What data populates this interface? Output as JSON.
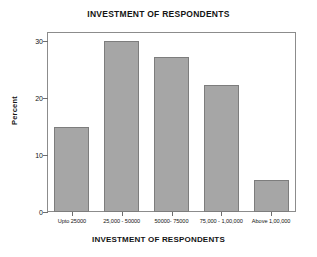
{
  "chart_data": {
    "type": "bar",
    "title": "INVESTMENT OF RESPONDENTS",
    "xlabel": "INVESTMENT OF RESPONDENTS",
    "ylabel": "Percent",
    "categories": [
      "Upto 25000",
      "25,000 - 50000",
      "50000- 75000",
      "75,000 - 1,00,000",
      "Above 1,00,000"
    ],
    "values": [
      14.8,
      30.0,
      27.2,
      22.3,
      5.6
    ],
    "ylim": [
      0,
      31.5
    ],
    "yticks": [
      0,
      10,
      20,
      30
    ],
    "ytick_labels": [
      "0",
      "10",
      "20",
      "30"
    ],
    "grid": false,
    "legend": false,
    "bar_color": "#a6a6a6",
    "bar_border_color": "#7d7d7d",
    "frame_color": "#8c8c8c",
    "background": "#ffffff"
  }
}
